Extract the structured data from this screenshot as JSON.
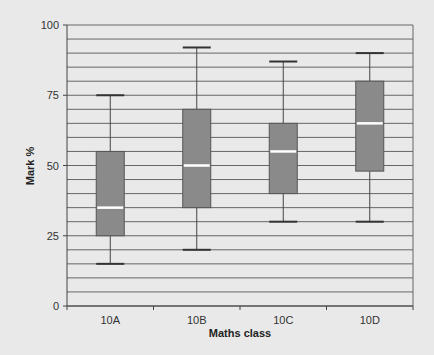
{
  "chart_data": {
    "type": "boxplot",
    "title": "",
    "xlabel": "Maths class",
    "ylabel": "Mark %",
    "ylim": [
      0,
      100
    ],
    "yticks": [
      0,
      25,
      50,
      75,
      100
    ],
    "grid_step": 5,
    "grid": true,
    "legend": null,
    "categories": [
      "10A",
      "10B",
      "10C",
      "10D"
    ],
    "boxes": [
      {
        "name": "10A",
        "min": 15,
        "q1": 25,
        "median": 35,
        "q3": 55,
        "max": 75
      },
      {
        "name": "10B",
        "min": 20,
        "q1": 35,
        "median": 50,
        "q3": 70,
        "max": 92
      },
      {
        "name": "10C",
        "min": 30,
        "q1": 40,
        "median": 55,
        "q3": 65,
        "max": 87
      },
      {
        "name": "10D",
        "min": 30,
        "q1": 48,
        "median": 65,
        "q3": 80,
        "max": 90
      }
    ],
    "colors": {
      "background": "#e9e9e9",
      "box_fill": "#8a8a8a",
      "box_edge": "#555555",
      "median": "#ffffff",
      "grid": "#666666",
      "whisker": "#444444"
    }
  }
}
